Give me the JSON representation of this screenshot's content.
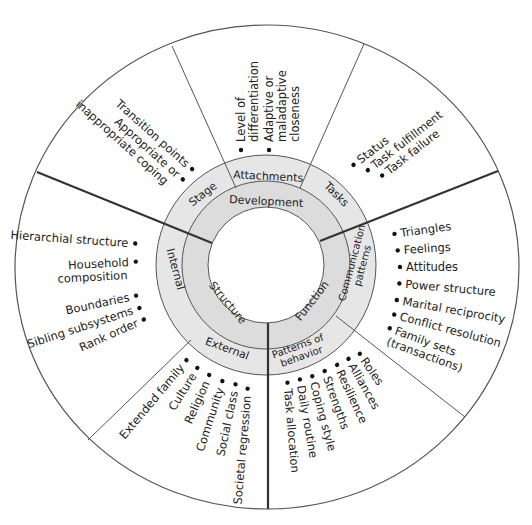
{
  "diagram": {
    "colors": {
      "outer_ring": "#e6e6e6",
      "inner_ring": "#dcdcdc",
      "lines": "#333333",
      "text": "#222222"
    },
    "center_categories": {
      "development": "Development",
      "structure": "Structure",
      "function": "Function"
    },
    "subcategories": {
      "stage": "Stage",
      "attachments": "Attachments",
      "tasks": "Tasks",
      "internal": "Internal",
      "external": "External",
      "communication_patterns": [
        "Communication",
        "patterns"
      ],
      "patterns_of_behavior": [
        "Patterns of",
        "behavior"
      ]
    },
    "items": {
      "stage": [
        "Transition points",
        "Appropriate or",
        "inappropriate coping"
      ],
      "attachments": [
        "Level of",
        "differentiation",
        "Adaptive or",
        "maladaptive",
        "closeness"
      ],
      "tasks": [
        "Status",
        "Task fulfillment",
        "Task failure"
      ],
      "internal": [
        "Hierarchial structure",
        "Household",
        "composition",
        "Boundaries",
        "Sibling subsystems",
        "Rank order"
      ],
      "external": [
        "Extended family",
        "Culture",
        "Religion",
        "Community",
        "Social class",
        "Societal regression"
      ],
      "communication_patterns": [
        "Triangles",
        "Feelings",
        "Attitudes",
        "Power structure",
        "Marital reciprocity",
        "Conflict resolution",
        "Family sets",
        "(transactions)"
      ],
      "patterns_of_behavior": [
        "Roles",
        "Alliances",
        "Resilience",
        "Strengths",
        "Coping style",
        "Daily routine",
        "Task allocation"
      ]
    }
  }
}
